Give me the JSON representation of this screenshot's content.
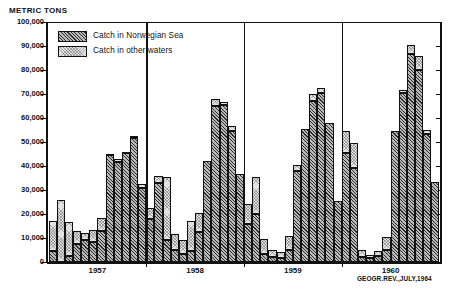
{
  "figure": {
    "units_title": "METRIC TONS",
    "source_note": "GEOGR.REV.,JULY,1964"
  },
  "legend": {
    "items": [
      {
        "label": "Catch in Norwegian Sea",
        "pattern": "diagonal-hatch",
        "color": "#b9b9b9"
      },
      {
        "label": "Catch in  other waters",
        "pattern": "stipple",
        "color": "#e2e2e2"
      }
    ]
  },
  "chart_data": {
    "type": "bar",
    "subtype": "stacked-bar",
    "title": "METRIC TONS",
    "xlabel": "",
    "ylabel": "METRIC TONS",
    "ylim": [
      0,
      100000
    ],
    "ytick_labels": [
      "0",
      "10,000",
      "20,000",
      "30,000",
      "40,000",
      "50,000",
      "60,000",
      "70,000",
      "80,000",
      "90,000",
      "100,000"
    ],
    "ytick_values": [
      0,
      10000,
      20000,
      30000,
      40000,
      50000,
      60000,
      70000,
      80000,
      90000,
      100000
    ],
    "grid": false,
    "legend_position": "top-left",
    "annotations": [
      "GEOGR.REV.,JULY,1964"
    ],
    "year_groups": [
      "1957",
      "1958",
      "1959",
      "1960"
    ],
    "categories": [
      "1957-01",
      "1957-02",
      "1957-03",
      "1957-04",
      "1957-05",
      "1957-06",
      "1957-07",
      "1957-08",
      "1957-09",
      "1957-10",
      "1957-11",
      "1957-12",
      "1958-01",
      "1958-02",
      "1958-03",
      "1958-04",
      "1958-05",
      "1958-06",
      "1958-07",
      "1958-08",
      "1958-09",
      "1958-10",
      "1958-11",
      "1958-12",
      "1959-01",
      "1959-02",
      "1959-03",
      "1959-04",
      "1959-05",
      "1959-06",
      "1959-07",
      "1959-08",
      "1959-09",
      "1959-10",
      "1959-11",
      "1959-12",
      "1960-01",
      "1960-02",
      "1960-03",
      "1960-04",
      "1960-05",
      "1960-06",
      "1960-07",
      "1960-08",
      "1960-09",
      "1960-10",
      "1960-11",
      "1960-12"
    ],
    "series": [
      {
        "name": "Catch in Norwegian Sea",
        "values": [
          4500,
          0,
          2500,
          7500,
          9000,
          8500,
          13000,
          44500,
          41500,
          45500,
          51500,
          31000,
          18000,
          33000,
          9000,
          5000,
          3500,
          4500,
          12500,
          42000,
          65000,
          65500,
          54500,
          36500,
          16000,
          20000,
          3500,
          2000,
          1500,
          5000,
          38000,
          55500,
          67000,
          70500,
          58000,
          25500,
          45500,
          39000,
          2000,
          1500,
          2500,
          5000,
          54500,
          70500,
          86500,
          80000,
          53500,
          33500
        ]
      },
      {
        "name": "Catch in  other waters",
        "values": [
          12500,
          26000,
          14000,
          5500,
          3000,
          5000,
          5500,
          500,
          1500,
          500,
          1000,
          1500,
          4500,
          3000,
          26500,
          6500,
          5500,
          12500,
          8000,
          0,
          3000,
          1000,
          2000,
          0,
          8000,
          15500,
          6000,
          3000,
          2500,
          6000,
          2500,
          0,
          3000,
          2000,
          0,
          0,
          9000,
          10500,
          3000,
          1500,
          2000,
          5500,
          0,
          1000,
          4000,
          6000,
          1500,
          0
        ]
      }
    ],
    "totals": [
      17000,
      26000,
      16500,
      13000,
      12000,
      13500,
      18500,
      45000,
      43000,
      46000,
      52500,
      32500,
      22500,
      36000,
      35500,
      11500,
      9000,
      17000,
      20500,
      42000,
      68000,
      66500,
      56500,
      36500,
      24000,
      35500,
      9500,
      5000,
      4000,
      11000,
      40500,
      55500,
      70000,
      72500,
      58000,
      25500,
      54500,
      49500,
      5000,
      3000,
      4500,
      10500,
      54500,
      71500,
      90500,
      86000,
      55000,
      33500
    ]
  }
}
